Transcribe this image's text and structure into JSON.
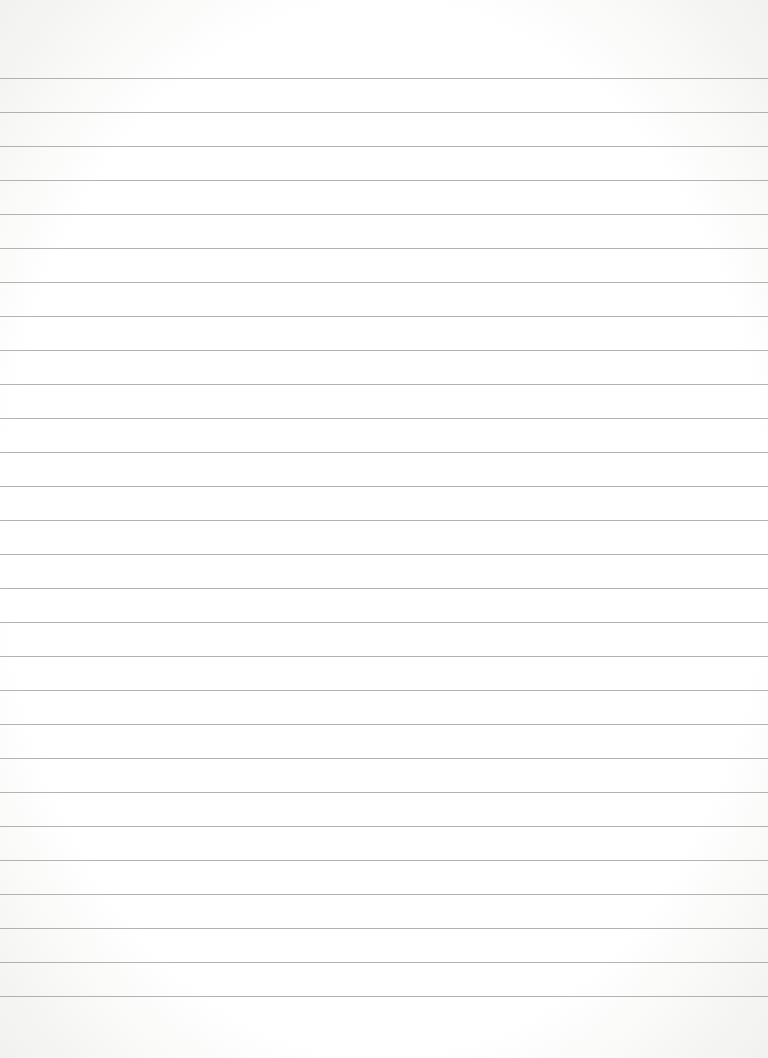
{
  "page": {
    "type": "lined-paper",
    "background_color": "#ffffff",
    "rule_color": "#9a9a98",
    "rules": {
      "count": 28,
      "first_y": 78,
      "spacing": 34
    }
  }
}
